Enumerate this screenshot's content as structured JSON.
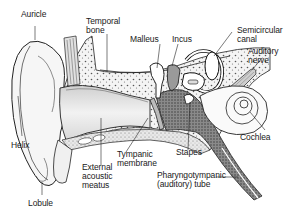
{
  "figure": {
    "labels": {
      "auricle": "Auricle",
      "temporal_bone": "Temporal\nbone",
      "malleus": "Malleus",
      "incus": "Incus",
      "semicircular_canal": "Semicircular\ncanal",
      "auditory_nerve": "Auditory\nnerve",
      "cochlea": "Cochlea",
      "stapes": "Stapes",
      "pharyngotympanic_tube": "Pharyngotympanic\n(auditory) tube",
      "tympanic_membrane": "Tympanic\nmembrane",
      "external_acoustic_meatus": "External\nacoustic\nmeatus",
      "helix": "Helix",
      "lobule": "Lobule"
    }
  }
}
